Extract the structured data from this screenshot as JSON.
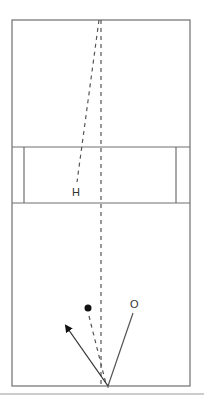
{
  "diagram": {
    "type": "court-diagram",
    "colors": {
      "line": "#6f6f6f",
      "dash": "#555555",
      "marker": "#111111",
      "separator": "#9a9a9a",
      "background": "#ffffff"
    },
    "court": {
      "x": 12,
      "y": 20,
      "width": 178,
      "height": 366
    },
    "band": {
      "top": 147,
      "bottom": 203,
      "inner_left_x": 24,
      "inner_right_x": 176
    },
    "labels": {
      "h": {
        "text": "H",
        "x": 76,
        "y": 196
      },
      "o": {
        "text": "O",
        "x": 134,
        "y": 308
      }
    },
    "markers": {
      "ball": {
        "x": 88,
        "y": 308,
        "r": 3.5
      }
    },
    "paths": {
      "center_dashed": {
        "x1": 101,
        "y1": 20,
        "x2": 101,
        "y2": 386
      },
      "slant_dashed": {
        "x1": 99,
        "y1": 20,
        "x2": 77,
        "y2": 182
      },
      "ball_dashed": {
        "x1": 89,
        "y1": 316,
        "x2": 106,
        "y2": 384
      },
      "o_solid": {
        "x1": 133,
        "y1": 313,
        "x2": 108,
        "y2": 386
      },
      "arrow": {
        "x1": 108,
        "y1": 386,
        "x2": 64,
        "y2": 323
      }
    },
    "origin_point": {
      "x": 108,
      "y": 386
    },
    "separator_y": 394
  }
}
